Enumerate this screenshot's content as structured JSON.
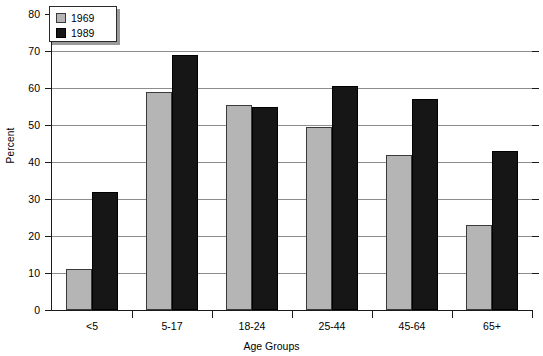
{
  "chart_data": {
    "type": "bar",
    "title": "",
    "xlabel": "Age Groups",
    "ylabel": "Percent",
    "categories": [
      "<5",
      "5-17",
      "18-24",
      "25-44",
      "45-64",
      "65+"
    ],
    "series": [
      {
        "name": "1969",
        "color": "#b5b5b5",
        "values": [
          11,
          59,
          55.5,
          49.5,
          42,
          23
        ]
      },
      {
        "name": "1989",
        "color": "#161616",
        "values": [
          32,
          69,
          55,
          60.5,
          57,
          43
        ]
      }
    ],
    "ylim": [
      0,
      80
    ],
    "ytick_values": [
      0,
      10,
      20,
      30,
      40,
      50,
      60,
      70,
      80
    ],
    "ytick_labels": [
      "0",
      "10",
      "20",
      "30",
      "40",
      "50",
      "60",
      "70",
      "80"
    ],
    "grid": "horizontal",
    "legend_position": "top-left",
    "legend_entries": [
      "1969",
      "1989"
    ]
  }
}
